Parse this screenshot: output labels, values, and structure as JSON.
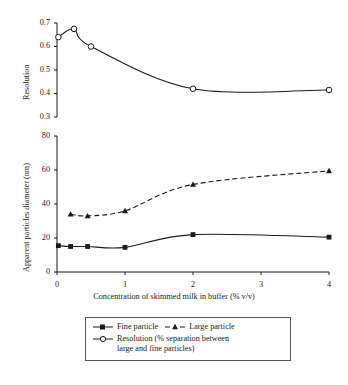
{
  "figure": {
    "width": 348,
    "height": 385,
    "background": "#ffffff",
    "line_color": "#1a1a1a"
  },
  "legend": {
    "items": [
      {
        "label": "Fine particle",
        "marker": "filled-square",
        "line": "solid"
      },
      {
        "label": "Large particle",
        "marker": "filled-triangle",
        "line": "dashed"
      },
      {
        "label": "Resolution (% separation between",
        "label2": "large and fine particles)",
        "marker": "open-circle",
        "line": "solid"
      }
    ]
  },
  "chart_data": [
    {
      "type": "line",
      "panel": "top",
      "title": "",
      "xlabel": "",
      "ylabel": "Resolution",
      "xlim": [
        0,
        4
      ],
      "ylim": [
        0.3,
        0.7
      ],
      "xticks": [
        0,
        1,
        2,
        3,
        4
      ],
      "yticks": [
        0.3,
        0.4,
        0.5,
        0.6,
        0.7
      ],
      "ytick_labels": [
        "0.3",
        "0.4",
        "0.5",
        "0.6",
        "0.7"
      ],
      "grid": false,
      "legend_position": "below-figure",
      "series": [
        {
          "name": "Resolution (% separation between large and fine particles)",
          "marker": "open-circle",
          "line": "solid",
          "x": [
            0.02,
            0.25,
            0.5,
            2.0,
            4.0
          ],
          "y": [
            0.64,
            0.675,
            0.6,
            0.42,
            0.415
          ]
        }
      ]
    },
    {
      "type": "line",
      "panel": "bottom",
      "title": "",
      "xlabel": "Concentration of skimmed milk in buffer (% v/v)",
      "ylabel": "Apparent particles diameter (nm)",
      "xlim": [
        0,
        4
      ],
      "ylim": [
        0,
        80
      ],
      "xticks": [
        0,
        1,
        2,
        3,
        4
      ],
      "xtick_labels": [
        "0",
        "1",
        "2",
        "3",
        "4"
      ],
      "yticks": [
        0,
        20,
        40,
        60,
        80
      ],
      "ytick_labels": [
        "0",
        "20",
        "40",
        "60",
        "80"
      ],
      "grid": false,
      "legend_position": "below-figure",
      "series": [
        {
          "name": "Fine particle",
          "marker": "filled-square",
          "line": "solid",
          "x": [
            0.02,
            0.2,
            0.45,
            1.0,
            2.0,
            4.0
          ],
          "y": [
            15.5,
            15.0,
            15.0,
            14.5,
            22.0,
            20.5
          ]
        },
        {
          "name": "Large particle",
          "marker": "filled-triangle",
          "line": "dashed",
          "x": [
            0.2,
            0.45,
            1.0,
            2.0,
            4.0
          ],
          "y": [
            34.0,
            33.0,
            36.0,
            51.5,
            59.5
          ]
        }
      ]
    }
  ]
}
